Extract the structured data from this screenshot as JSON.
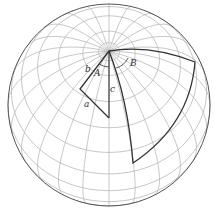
{
  "figure": {
    "labels": {
      "b": "b",
      "A": "A",
      "c": "c",
      "a": "a",
      "B": "B"
    }
  },
  "colors": {
    "grid": "#b8b8b8",
    "outline": "#555555",
    "triangle": "#333333",
    "text": "#333333"
  },
  "globe": {
    "center": [
      109,
      105
    ],
    "radius": 101,
    "view_lat_deg": 58,
    "parallel_step_deg": 15,
    "meridian_step_deg": 15
  }
}
